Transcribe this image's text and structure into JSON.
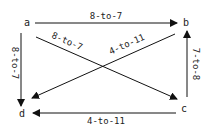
{
  "nodes": [
    {
      "id": "a",
      "label": "a"
    },
    {
      "id": "b",
      "label": "b"
    },
    {
      "id": "c",
      "label": "c"
    },
    {
      "id": "d",
      "label": "d"
    }
  ],
  "edges": [
    {
      "from": "a",
      "to": "b",
      "label": "8-to-7"
    },
    {
      "from": "a",
      "to": "d",
      "label": "8-to-7"
    },
    {
      "from": "a",
      "to": "c",
      "label": "8-to-7"
    },
    {
      "from": "b",
      "to": "d",
      "label": "4-to-11"
    },
    {
      "from": "c",
      "to": "b",
      "label": "7-to-8"
    },
    {
      "from": "c",
      "to": "d",
      "label": "4-to-11"
    }
  ]
}
